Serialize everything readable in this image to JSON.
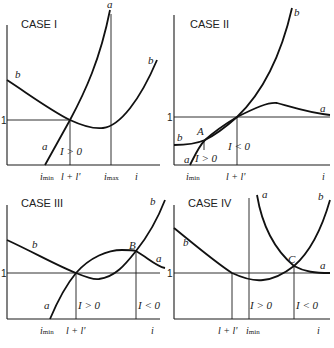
{
  "panels": [
    {
      "title": "CASE I",
      "y_tick": "1",
      "curve_labels": {
        "b_left": "b",
        "a_top": "a",
        "b_right": "b",
        "a_bottom": "a"
      },
      "region_labels": [
        "I > 0"
      ],
      "x_ticks": [
        "imin",
        "l + l'",
        "imax",
        "i"
      ],
      "x_tick_display": {
        "imin_main": "i",
        "imin_sub": "min",
        "ll": "l + l'",
        "imax_main": "i",
        "imax_sub": "max",
        "axis": "i"
      }
    },
    {
      "title": "CASE II",
      "y_tick": "1",
      "curve_labels": {
        "b_top": "b",
        "a_right": "a",
        "b_left": "b",
        "a_bottom": "a"
      },
      "points": [
        "A"
      ],
      "region_labels": [
        "I > 0",
        "I < 0"
      ],
      "x_ticks": [
        "imin",
        "l + l'",
        "i"
      ],
      "x_tick_display": {
        "imin_main": "i",
        "imin_sub": "min",
        "ll": "l + l'",
        "axis": "i"
      }
    },
    {
      "title": "CASE III",
      "y_tick": "1",
      "curve_labels": {
        "b_left": "b",
        "b_top": "b",
        "a_right": "a",
        "a_bottom": "a"
      },
      "points": [
        "B"
      ],
      "region_labels": [
        "I > 0",
        "I < 0"
      ],
      "x_ticks": [
        "imin",
        "l + l'",
        "i"
      ],
      "x_tick_display": {
        "imin_main": "i",
        "imin_sub": "min",
        "ll": "l + l'",
        "axis": "i"
      }
    },
    {
      "title": "CASE IV",
      "y_tick": "1",
      "curve_labels": {
        "b_left": "b",
        "a_top": "a",
        "b_top": "b",
        "a_right": "a"
      },
      "points": [
        "C"
      ],
      "region_labels": [
        "I > 0",
        "I < 0"
      ],
      "x_ticks": [
        "l + l'",
        "imin",
        "i"
      ],
      "x_tick_display": {
        "ll": "l + l'",
        "imin_main": "i",
        "imin_sub": "min",
        "axis": "i"
      }
    }
  ]
}
